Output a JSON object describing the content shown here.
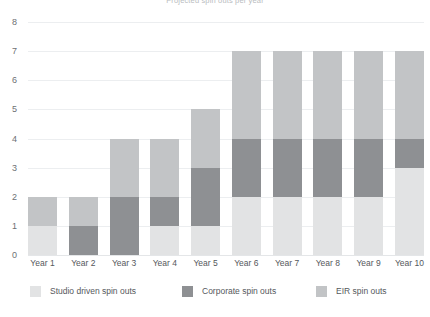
{
  "title": "Projected spin outs per year",
  "chart_data": {
    "type": "bar",
    "subtype": "stacked-bar",
    "title": "Projected spin outs per year",
    "xlabel": "",
    "ylabel": "",
    "ylim": [
      0,
      8
    ],
    "ytick_step": 1,
    "yticks": [
      "8",
      "7",
      "6",
      "5",
      "4",
      "3",
      "2",
      "1",
      "0"
    ],
    "grid": true,
    "legend_position": "bottom",
    "categories": [
      "Year 1",
      "Year 2",
      "Year 3",
      "Year 4",
      "Year 5",
      "Year 6",
      "Year 7",
      "Year 8",
      "Year 9",
      "Year 10"
    ],
    "stack_order_bottom_to_top": [
      "Studio driven spin outs",
      "Corporate spin outs",
      "EIR spin outs"
    ],
    "series": [
      {
        "name": "Studio driven spin outs",
        "color": "#e2e3e4",
        "values": [
          1,
          0,
          0,
          1,
          1,
          2,
          2,
          2,
          2,
          3
        ]
      },
      {
        "name": "Corporate spin outs",
        "color": "#8e9093",
        "values": [
          0,
          1,
          2,
          1,
          2,
          2,
          2,
          2,
          2,
          1
        ]
      },
      {
        "name": "EIR spin outs",
        "color": "#c2c4c6",
        "values": [
          1,
          1,
          2,
          2,
          2,
          3,
          3,
          3,
          3,
          3
        ]
      }
    ],
    "totals": [
      2,
      2,
      4,
      4,
      5,
      7,
      7,
      7,
      7,
      7
    ]
  },
  "legend": {
    "items": [
      {
        "label": "Studio driven spin outs",
        "color": "#e2e3e4"
      },
      {
        "label": "Corporate spin outs",
        "color": "#8e9093"
      },
      {
        "label": "EIR spin outs",
        "color": "#c2c4c6"
      }
    ]
  }
}
